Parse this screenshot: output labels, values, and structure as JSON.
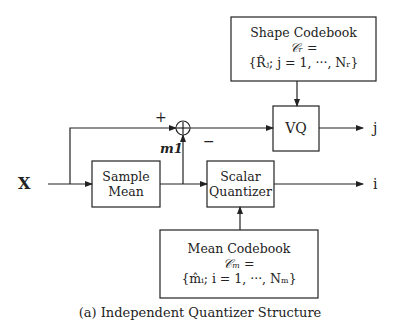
{
  "diagram": {
    "input_label": "X",
    "sum_sign_plus": "+",
    "sum_sign_minus": "−",
    "mean_signal_label": "m1",
    "output_j": "j",
    "output_i": "i",
    "blocks": {
      "sample_mean": {
        "line1": "Sample",
        "line2": "Mean"
      },
      "scalar_quantizer": {
        "line1": "Scalar",
        "line2": "Quantizer"
      },
      "vq": {
        "label": "VQ"
      },
      "shape_codebook": {
        "title": "Shape Codebook",
        "line2": "𝒞ᵣ =",
        "line3": "{R̂ⱼ; j = 1, ···, Nᵣ}"
      },
      "mean_codebook": {
        "title": "Mean Codebook",
        "line2": "𝒞ₘ =",
        "line3": "{m̂ᵢ; i = 1, ···, Nₘ}"
      }
    },
    "caption": "(a) Independent Quantizer Structure"
  }
}
